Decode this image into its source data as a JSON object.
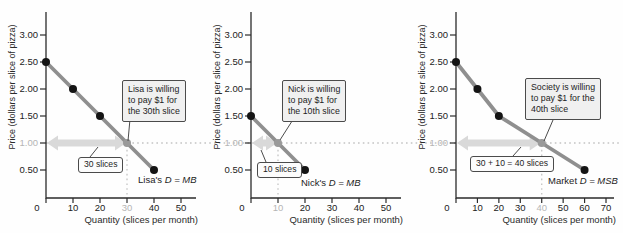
{
  "figure": {
    "title": "",
    "colors": {
      "curve": "#8f8f8f",
      "point": "#141414",
      "point_highlight": "#9a9a9a",
      "arrow_fill": "#d9d9d9",
      "dotted_line": "#c4c4c4",
      "axis": "#2b2b2b",
      "leader_line": "#4b4b4b",
      "muted_tick_text": "#b5b5b5"
    }
  },
  "chart_data": [
    {
      "type": "line",
      "title": "",
      "ylabel": "Price (dollars per slice of pizza)",
      "xlabel": "Quantity (slices per month)",
      "xlim": [
        0,
        50
      ],
      "ylim": [
        0.25,
        3.3
      ],
      "x_ticks": [
        0,
        10,
        20,
        30,
        40,
        50
      ],
      "y_ticks": [
        "0.50",
        "1.00",
        "1.50",
        "2.00",
        "2.50",
        "3.00"
      ],
      "grid": "off",
      "points": [
        [
          0,
          2.5
        ],
        [
          10,
          2.0
        ],
        [
          20,
          1.5
        ],
        [
          30,
          1.0
        ],
        [
          40,
          0.5
        ]
      ],
      "highlight_point": [
        30,
        1.0
      ],
      "highlight_x_tick": 30,
      "highlight_y_tick": "1.00",
      "span_arrow": [
        0,
        30
      ],
      "span_label": "30 slices",
      "callout_lines": [
        "Lisa is willing",
        "to pay $1 for",
        "the 30th slice"
      ],
      "curve_label_prefix": "Lisa's ",
      "curve_label_math": "D = MB"
    },
    {
      "type": "line",
      "title": "",
      "ylabel": "Price (dollars per slice of pizza)",
      "xlabel": "Quantity (slices per month)",
      "xlim": [
        0,
        50
      ],
      "ylim": [
        0.25,
        3.3
      ],
      "x_ticks": [
        0,
        10,
        20,
        30,
        40,
        50
      ],
      "y_ticks": [
        "0.50",
        "1.00",
        "1.50",
        "2.00",
        "2.50",
        "3.00"
      ],
      "grid": "off",
      "points": [
        [
          0,
          1.5
        ],
        [
          10,
          1.0
        ],
        [
          20,
          0.5
        ]
      ],
      "highlight_point": [
        10,
        1.0
      ],
      "highlight_x_tick": 10,
      "highlight_y_tick": "1.00",
      "span_arrow": [
        0,
        10
      ],
      "span_label": "10 slices",
      "callout_lines": [
        "Nick is willing",
        "to pay $1 for",
        "the 10th slice"
      ],
      "curve_label_prefix": "Nick's ",
      "curve_label_math": "D = MB"
    },
    {
      "type": "line",
      "title": "",
      "ylabel": "Price (dollars per slice of pizza)",
      "xlabel": "Quantity (slices per month)",
      "xlim": [
        0,
        70
      ],
      "ylim": [
        0.25,
        3.3
      ],
      "x_ticks": [
        0,
        10,
        20,
        30,
        40,
        50,
        60,
        70
      ],
      "y_ticks": [
        "0.50",
        "1.00",
        "1.50",
        "2.00",
        "2.50",
        "3.00"
      ],
      "grid": "off",
      "points": [
        [
          0,
          2.5
        ],
        [
          10,
          2.0
        ],
        [
          20,
          1.5
        ],
        [
          40,
          1.0
        ],
        [
          60,
          0.5
        ]
      ],
      "highlight_point": [
        40,
        1.0
      ],
      "highlight_x_tick": 40,
      "highlight_y_tick": "1.00",
      "span_arrow": [
        0,
        40
      ],
      "span_label": "30 + 10 = 40 slices",
      "callout_lines": [
        "Society is willing",
        "to pay $1 for the",
        "40th slice"
      ],
      "curve_label_prefix": "Market ",
      "curve_label_math": "D = MSB"
    }
  ]
}
